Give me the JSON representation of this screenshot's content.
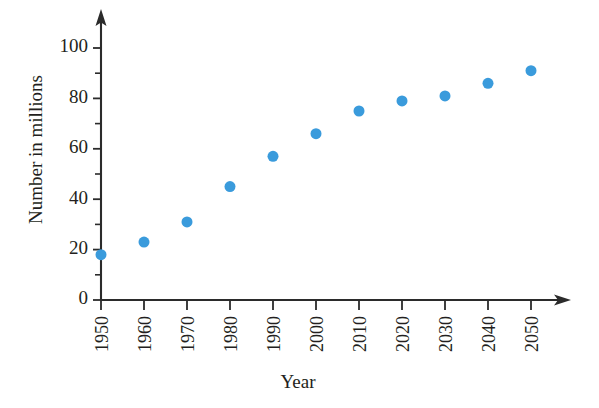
{
  "chart_data": {
    "type": "scatter",
    "title": "",
    "xlabel": "Year",
    "ylabel": "Number in millions",
    "x": [
      1950,
      1960,
      1970,
      1980,
      1990,
      2000,
      2010,
      2020,
      2030,
      2040,
      2050
    ],
    "values": [
      18,
      23,
      31,
      45,
      57,
      66,
      75,
      79,
      81,
      86,
      91
    ],
    "categories": [
      "1950",
      "1960",
      "1970",
      "1980",
      "1990",
      "2000",
      "2010",
      "2020",
      "2030",
      "2040",
      "2050"
    ],
    "xlim": [
      1950,
      2055
    ],
    "ylim": [
      0,
      108
    ],
    "y_major_ticks": [
      0,
      20,
      40,
      60,
      80,
      100
    ],
    "y_major_tick_labels": [
      "0",
      "20",
      "40",
      "60",
      "80",
      "100"
    ],
    "y_minor_ticks": [
      10,
      30,
      50,
      70,
      90
    ],
    "grid": false,
    "legend": false,
    "marker_color": "#3a9bdc",
    "axis_color": "#2b2b2b",
    "marker_size": 11
  },
  "axes": {
    "x_axis_name": "year-axis",
    "y_axis_name": "count-axis",
    "x_label": "Year",
    "y_label": "Number in millions"
  }
}
